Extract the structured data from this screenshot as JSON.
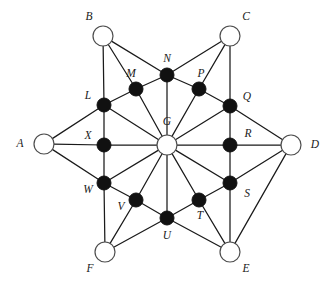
{
  "figure": {
    "background_color": "#ffffff",
    "edge_color": "#1a1a1a",
    "open_node_fill": "#ffffff",
    "open_node_stroke": "#4d4d4d",
    "filled_node_fill": "#111111",
    "label_color": "#1a1a1a"
  },
  "nodes": [
    {
      "id": "A",
      "label": "A",
      "x": 44,
      "y": 144,
      "r": 10,
      "style": "open",
      "label_x": 20,
      "label_y": 144,
      "anchor": "middle"
    },
    {
      "id": "B",
      "label": "B",
      "x": 103,
      "y": 36,
      "r": 10,
      "style": "open",
      "label_x": 89,
      "label_y": 17,
      "anchor": "middle"
    },
    {
      "id": "C",
      "label": "C",
      "x": 230,
      "y": 36,
      "r": 10,
      "style": "open",
      "label_x": 246,
      "label_y": 17,
      "anchor": "middle"
    },
    {
      "id": "D",
      "label": "D",
      "x": 291,
      "y": 145,
      "r": 10,
      "style": "open",
      "label_x": 315,
      "label_y": 145,
      "anchor": "middle"
    },
    {
      "id": "E",
      "label": "E",
      "x": 230,
      "y": 252,
      "r": 10,
      "style": "open",
      "label_x": 246,
      "label_y": 269,
      "anchor": "middle"
    },
    {
      "id": "F",
      "label": "F",
      "x": 105,
      "y": 252,
      "r": 10,
      "style": "open",
      "label_x": 90,
      "label_y": 269,
      "anchor": "middle"
    },
    {
      "id": "G",
      "label": "G",
      "x": 167,
      "y": 145,
      "r": 10,
      "style": "open",
      "label_x": 167,
      "label_y": 122,
      "anchor": "middle"
    },
    {
      "id": "L",
      "label": "L",
      "x": 104,
      "y": 105,
      "r": 7,
      "style": "filled",
      "label_x": 88,
      "label_y": 96,
      "anchor": "middle"
    },
    {
      "id": "M",
      "label": "M",
      "x": 136,
      "y": 89,
      "r": 7,
      "style": "filled",
      "label_x": 131,
      "label_y": 74,
      "anchor": "middle"
    },
    {
      "id": "N",
      "label": "N",
      "x": 167,
      "y": 75,
      "r": 7,
      "style": "filled",
      "label_x": 167,
      "label_y": 59,
      "anchor": "middle"
    },
    {
      "id": "P",
      "label": "P",
      "x": 199,
      "y": 89,
      "r": 7,
      "style": "filled",
      "label_x": 201,
      "label_y": 74,
      "anchor": "middle"
    },
    {
      "id": "Q",
      "label": "Q",
      "x": 230,
      "y": 106,
      "r": 7,
      "style": "filled",
      "label_x": 247,
      "label_y": 97,
      "anchor": "middle"
    },
    {
      "id": "R",
      "label": "R",
      "x": 230,
      "y": 145,
      "r": 7,
      "style": "filled",
      "label_x": 248,
      "label_y": 134,
      "anchor": "middle"
    },
    {
      "id": "S",
      "label": "S",
      "x": 230,
      "y": 183,
      "r": 7,
      "style": "filled",
      "label_x": 247,
      "label_y": 194,
      "anchor": "middle"
    },
    {
      "id": "T",
      "label": "T",
      "x": 199,
      "y": 200,
      "r": 7,
      "style": "filled",
      "label_x": 200,
      "label_y": 216,
      "anchor": "middle"
    },
    {
      "id": "U",
      "label": "U",
      "x": 167,
      "y": 218,
      "r": 7,
      "style": "filled",
      "label_x": 167,
      "label_y": 236,
      "anchor": "middle"
    },
    {
      "id": "V",
      "label": "V",
      "x": 136,
      "y": 200,
      "r": 7,
      "style": "filled",
      "label_x": 121,
      "label_y": 207,
      "anchor": "middle"
    },
    {
      "id": "W",
      "label": "W",
      "x": 104,
      "y": 183,
      "r": 7,
      "style": "filled",
      "label_x": 88,
      "label_y": 190,
      "anchor": "middle"
    },
    {
      "id": "X",
      "label": "X",
      "x": 104,
      "y": 145,
      "r": 7,
      "style": "filled",
      "label_x": 88,
      "label_y": 136,
      "anchor": "middle"
    }
  ],
  "edges": [
    [
      "A",
      "L"
    ],
    [
      "A",
      "X"
    ],
    [
      "A",
      "W"
    ],
    [
      "B",
      "L"
    ],
    [
      "B",
      "M"
    ],
    [
      "B",
      "N"
    ],
    [
      "C",
      "N"
    ],
    [
      "C",
      "P"
    ],
    [
      "C",
      "Q"
    ],
    [
      "D",
      "Q"
    ],
    [
      "D",
      "R"
    ],
    [
      "D",
      "S"
    ],
    [
      "D",
      "E"
    ],
    [
      "E",
      "S"
    ],
    [
      "E",
      "T"
    ],
    [
      "E",
      "U"
    ],
    [
      "F",
      "W"
    ],
    [
      "F",
      "V"
    ],
    [
      "F",
      "U"
    ],
    [
      "L",
      "X"
    ],
    [
      "X",
      "W"
    ],
    [
      "Q",
      "R"
    ],
    [
      "R",
      "S"
    ],
    [
      "L",
      "M"
    ],
    [
      "M",
      "N"
    ],
    [
      "N",
      "P"
    ],
    [
      "P",
      "Q"
    ],
    [
      "W",
      "V"
    ],
    [
      "V",
      "U"
    ],
    [
      "U",
      "T"
    ],
    [
      "T",
      "S"
    ],
    [
      "G",
      "L"
    ],
    [
      "G",
      "M"
    ],
    [
      "G",
      "N"
    ],
    [
      "G",
      "P"
    ],
    [
      "G",
      "Q"
    ],
    [
      "G",
      "R"
    ],
    [
      "G",
      "S"
    ],
    [
      "G",
      "T"
    ],
    [
      "G",
      "U"
    ],
    [
      "G",
      "V"
    ],
    [
      "G",
      "W"
    ],
    [
      "G",
      "X"
    ]
  ]
}
